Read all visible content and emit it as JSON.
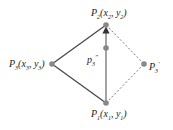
{
  "diagram": {
    "points": {
      "p1": {
        "label": "P",
        "sub": "1",
        "coords": "(x",
        "c1sub": "1",
        "mid": ", y",
        "c2sub": "1",
        "end": ")"
      },
      "p2": {
        "label": "P",
        "sub": "2",
        "coords": "(x",
        "c1sub": "2",
        "mid": ", y",
        "c2sub": "2",
        "end": ")"
      },
      "p3": {
        "label": "P",
        "sub": "3",
        "coords": "(x",
        "c1sub": "3",
        "mid": ", y",
        "c2sub": "3",
        "end": ")"
      },
      "p3prime": {
        "label": "P",
        "sub": "3",
        "prime": "'"
      },
      "p3dprime": {
        "label": "p",
        "sub": "3",
        "prime": "\""
      }
    },
    "colors": {
      "solid_line": "#444444",
      "dashed_line": "#555555",
      "point_fill": "#888888",
      "text": "#222222"
    }
  }
}
